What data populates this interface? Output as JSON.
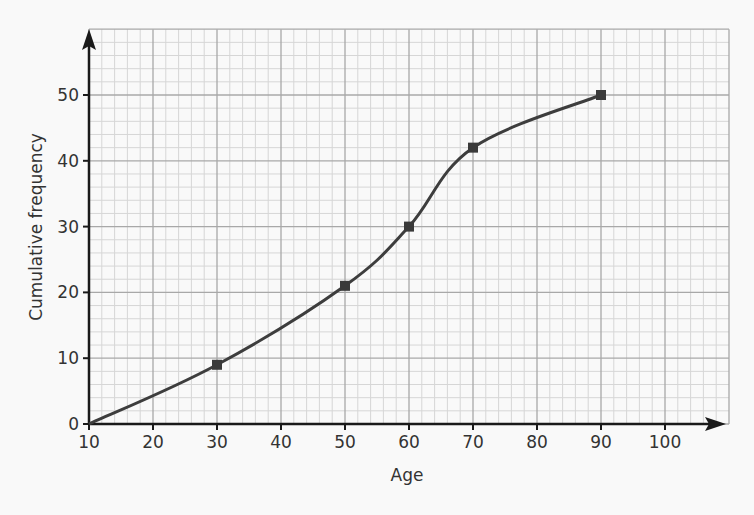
{
  "chart_data": {
    "type": "line",
    "title": "",
    "xlabel": "Age",
    "ylabel": "Cumulative frequency",
    "x": [
      10,
      30,
      50,
      60,
      70,
      90
    ],
    "series": [
      {
        "name": "Cumulative frequency",
        "values": [
          0,
          9,
          21,
          30,
          42,
          50
        ],
        "markers": [
          false,
          true,
          true,
          true,
          true,
          true
        ]
      }
    ],
    "xticks": [
      10,
      20,
      30,
      40,
      50,
      60,
      70,
      80,
      90,
      100
    ],
    "yticks": [
      0,
      10,
      20,
      30,
      40,
      50
    ],
    "xlim": [
      10,
      110
    ],
    "ylim": [
      0,
      60
    ],
    "grid": true,
    "grid_minor_step": 2,
    "legend": null,
    "smooth": true
  },
  "colors": {
    "background": "#f9f9f9",
    "grid_major": "#a8a8a8",
    "grid_minor": "#d6d6d6",
    "axis": "#1a1a1a",
    "line": "#3d3d3d",
    "marker": "#3a3a3a",
    "text": "#333333"
  }
}
